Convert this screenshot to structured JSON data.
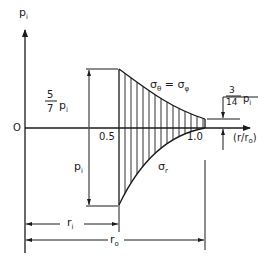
{
  "figure": {
    "y_axis_label": "p",
    "y_axis_label_sub": "i",
    "origin_label": "O",
    "x_axis_label": "(r/r",
    "x_axis_label_sub": "o",
    "x_axis_label_close": ")",
    "x_tick_inner": "0.5",
    "x_tick_outer": "1.0",
    "curve_upper_label": "σ",
    "curve_upper_label_sub": "θ",
    "curve_upper_label_eq": " = σ",
    "curve_upper_label_sub2": "φ",
    "curve_lower_label": "σ",
    "curve_lower_label_sub": "r",
    "dim_inner_upper_num": "5",
    "dim_inner_upper_den": "7",
    "dim_inner_upper_p": "p",
    "dim_inner_upper_p_sub": "i",
    "dim_inner_lower_p": "p",
    "dim_inner_lower_p_sub": "i",
    "dim_outer_num": "3",
    "dim_outer_den": "14",
    "dim_outer_p": "p",
    "dim_outer_p_sub": "i",
    "dim_ri": "r",
    "dim_ri_sub": "i",
    "dim_ro": "r",
    "dim_ro_sub": "o"
  },
  "colors": {
    "line": "#1a1a1a",
    "background": "#ffffff"
  },
  "values": {
    "r_inner_ratio": 0.5,
    "r_outer_ratio": 1.0,
    "sigma_theta_at_inner": "5/7 p_i",
    "sigma_r_at_inner": "-p_i",
    "sigma_theta_at_outer": "3/14 p_i",
    "sigma_r_at_outer": 0
  }
}
